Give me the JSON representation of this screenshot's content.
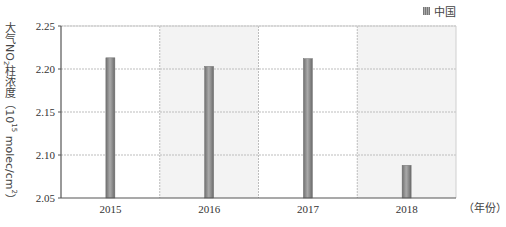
{
  "chart_data": {
    "type": "bar",
    "title": "",
    "categories": [
      "2015",
      "2016",
      "2017",
      "2018"
    ],
    "series": [
      {
        "name": "中国",
        "values": [
          2.213,
          2.203,
          2.212,
          2.088
        ]
      }
    ],
    "values": [
      2.213,
      2.203,
      2.212,
      2.088
    ],
    "xlabel": "（年份）",
    "ylabel": "大气NO₂柱浓度（10¹⁵ molec/cm²）",
    "ylim": [
      2.05,
      2.25
    ],
    "yticks": [
      "2.05",
      "2.10",
      "2.15",
      "2.20",
      "2.25"
    ],
    "grid": true,
    "legend_position": "top-right",
    "colors": {
      "bar": "#8c8c8c",
      "bar_edge": "#6e6e6e",
      "alt_column_bg": "#f3f3f3",
      "grid": "#bdbdbd",
      "axis": "#555555"
    }
  },
  "legend": {
    "label": "中国"
  },
  "yaxis": {
    "title_main": "大气",
    "title_no": "NO",
    "title_sub": "2",
    "title_rest": "柱浓度（10",
    "title_sup": "15",
    "title_unit": " molec/cm",
    "title_sup2": "2",
    "title_close": "）"
  },
  "xaxis": {
    "unit_label": "（年份）"
  }
}
